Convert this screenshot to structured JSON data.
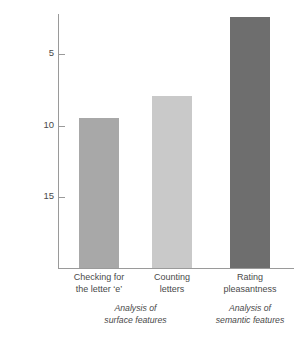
{
  "chart_data": {
    "type": "bar",
    "title": "",
    "xlabel": "",
    "ylabel": "Mean number of words recalled",
    "categories": [
      "Checking for the letter ‘e’",
      "Counting letters",
      "Rating pleasantness"
    ],
    "values": [
      10.5,
      12.0,
      17.5
    ],
    "ylim": [
      0,
      17.8
    ],
    "yticks": [
      5,
      10,
      15
    ],
    "ytick_labels": [
      "5",
      "10",
      "15"
    ],
    "grid": false,
    "legend": "none",
    "bar_colors": [
      "#a8a8a8",
      "#c9c9c9",
      "#6e6e6e"
    ],
    "axis_color": "#9a9a9a",
    "background": "#ffffff"
  },
  "axis": {
    "y_title": "Mean number of words recalled",
    "ticks": [
      {
        "label": "15",
        "value": 15
      },
      {
        "label": "10",
        "value": 10
      },
      {
        "label": "5",
        "value": 5
      }
    ]
  },
  "bars": [
    {
      "value": 10.5,
      "color": "#a8a8a8",
      "label_line1": "Checking for",
      "label_line2": "the letter ‘e’"
    },
    {
      "value": 12.0,
      "color": "#c9c9c9",
      "label_line1": "Counting",
      "label_line2": "letters"
    },
    {
      "value": 17.5,
      "color": "#6e6e6e",
      "label_line1": "Rating",
      "label_line2": "pleasantness"
    }
  ],
  "groups": [
    {
      "line1": "Analysis of",
      "line2": "surface features"
    },
    {
      "line1": "Analysis of",
      "line2": "semantic features"
    }
  ]
}
